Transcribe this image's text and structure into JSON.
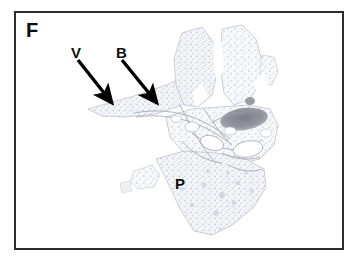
{
  "figure": {
    "panel_letter": "F",
    "background_color": "#ffffff",
    "frame_color": "#2c2c30",
    "image_type": "histology-micrograph",
    "tissue_description": "lung-section"
  },
  "labels": {
    "vessel": "V",
    "bronchiole": "B",
    "parenchyma": "P"
  },
  "annotations": {
    "arrows": [
      {
        "name": "arrow-vessel",
        "label": "V",
        "from_x": 78,
        "from_y": 60,
        "to_x": 112,
        "to_y": 103,
        "color": "#000000"
      },
      {
        "name": "arrow-bronchiole",
        "label": "B",
        "from_x": 122,
        "from_y": 60,
        "to_x": 157,
        "to_y": 103,
        "color": "#000000"
      }
    ]
  },
  "colors": {
    "tissue_fill": "#eceef2",
    "tissue_fill_light": "#f3f5f8",
    "tissue_outline": "#b8bcc6",
    "alveolar_speckle": "#c3c8d2",
    "dense_structure": "#8f9099",
    "airway_lumen": "#ffffff",
    "label_text": "#0d0d0f"
  }
}
